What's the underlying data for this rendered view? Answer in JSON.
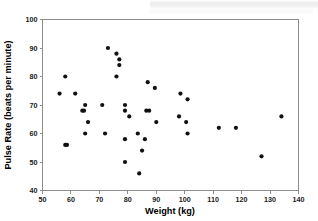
{
  "chart_data": {
    "type": "scatter",
    "title": "",
    "xlabel": "Weight (kg)",
    "ylabel": "Pulse Rate (beats per minute)",
    "xlim": [
      50,
      140
    ],
    "ylim": [
      40,
      100
    ],
    "xticks": [
      50,
      60,
      70,
      80,
      90,
      100,
      110,
      120,
      130,
      140
    ],
    "yticks": [
      40,
      50,
      60,
      70,
      80,
      90,
      100
    ],
    "grid": false,
    "legend": null,
    "marker": {
      "shape": "circle",
      "color": "#111111",
      "size": 2.1
    },
    "series": [
      {
        "name": "subjects",
        "points": [
          [
            56,
            74
          ],
          [
            58,
            80
          ],
          [
            58,
            56
          ],
          [
            58.6,
            56
          ],
          [
            61.5,
            74
          ],
          [
            64,
            68
          ],
          [
            64.6,
            68
          ],
          [
            65,
            70
          ],
          [
            65,
            60
          ],
          [
            66,
            64
          ],
          [
            71,
            70
          ],
          [
            72,
            60
          ],
          [
            73,
            90
          ],
          [
            76,
            88
          ],
          [
            76,
            80
          ],
          [
            77,
            86
          ],
          [
            77,
            84
          ],
          [
            79,
            70
          ],
          [
            79,
            68
          ],
          [
            79,
            58
          ],
          [
            79,
            50
          ],
          [
            80.5,
            66
          ],
          [
            83.5,
            60
          ],
          [
            84,
            46
          ],
          [
            85,
            54
          ],
          [
            86,
            58
          ],
          [
            86.5,
            68
          ],
          [
            87.5,
            68
          ],
          [
            87,
            78
          ],
          [
            89.5,
            76
          ],
          [
            90,
            64
          ],
          [
            98,
            66
          ],
          [
            98.5,
            74
          ],
          [
            101,
            72
          ],
          [
            100.5,
            64
          ],
          [
            101,
            60
          ],
          [
            112,
            62
          ],
          [
            118,
            62
          ],
          [
            127,
            52
          ],
          [
            134,
            66
          ]
        ]
      }
    ]
  },
  "axes": {
    "x_tick_labels": [
      "50",
      "60",
      "70",
      "80",
      "90",
      "100",
      "110",
      "120",
      "130",
      "140"
    ],
    "y_tick_labels": [
      "40",
      "50",
      "60",
      "70",
      "80",
      "90",
      "100"
    ],
    "x_title": "Weight (kg)",
    "y_title": "Pulse Rate (beats per minute)"
  },
  "colors": {
    "marker": "#111111",
    "axis": "#8c8c8c",
    "text": "#000000",
    "background": "#ffffff"
  }
}
